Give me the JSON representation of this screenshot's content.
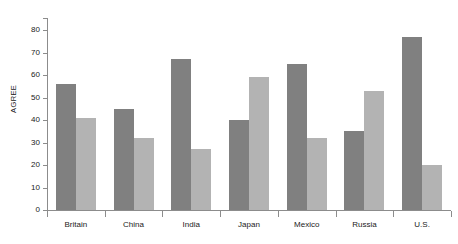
{
  "chart_data": {
    "type": "bar",
    "title": "",
    "subtitle": "",
    "xlabel": "",
    "ylabel": "AGREE",
    "categories": [
      "Britain",
      "China",
      "India",
      "Japan",
      "Mexico",
      "Russia",
      "U.S."
    ],
    "series": [
      {
        "name": "series-1",
        "color": "#808080",
        "values": [
          56,
          45,
          67,
          40,
          65,
          35,
          77
        ]
      },
      {
        "name": "series-2",
        "color": "#b3b3b3",
        "values": [
          41,
          32,
          27,
          59,
          32,
          53,
          20
        ]
      }
    ],
    "ylim": [
      0,
      80
    ],
    "ytick_labels": [
      "0",
      "10",
      "20",
      "30",
      "40",
      "50",
      "60",
      "70",
      "80"
    ],
    "ytick_values": [
      0,
      10,
      20,
      30,
      40,
      50,
      60,
      70,
      80
    ],
    "grid": false,
    "legend": false,
    "legend_position": "none",
    "background_color": "#ffffff",
    "axis_color": "#8c8c8c"
  }
}
